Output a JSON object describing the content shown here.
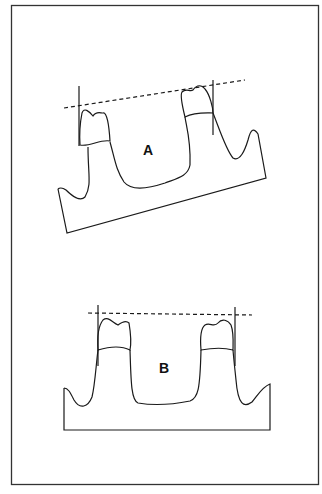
{
  "figure": {
    "panels": [
      {
        "id": "A",
        "label": "A",
        "description": "Tilted arch segment with two abutment teeth; dashed occlusal plane line sloping, vertical long-axis lines"
      },
      {
        "id": "B",
        "label": "B",
        "description": "Level arch segment with two abutment teeth; horizontal dashed occlusal plane line, vertical long-axis lines"
      }
    ]
  },
  "colors": {
    "line": "#1a1a1a",
    "background": "#ffffff"
  }
}
